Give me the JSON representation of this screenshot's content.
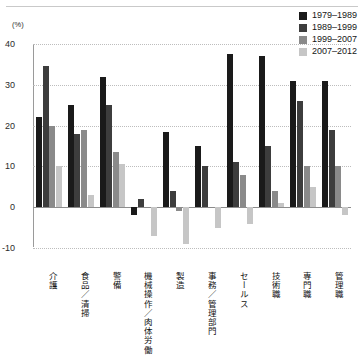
{
  "chart_data": {
    "type": "bar",
    "title": "",
    "xlabel": "",
    "ylabel": "(%)",
    "unit_label": "(%)",
    "ylim": [
      -10,
      40
    ],
    "yticks": [
      40,
      30,
      20,
      10,
      0,
      -10
    ],
    "ytick_labels": [
      "40",
      "30",
      "20",
      "10",
      "0",
      "-10"
    ],
    "grid": true,
    "legend_position": "top-right",
    "categories": [
      "介護",
      "食品／清掃",
      "警備",
      "機械操作／肉体労働",
      "製造",
      "事務／管理部門",
      "セールス",
      "技術職",
      "専門職",
      "管理職"
    ],
    "series": [
      {
        "name": "1979–1989",
        "color": "#1a1a1a",
        "values": [
          22,
          25,
          32,
          -2,
          18.5,
          15,
          37.5,
          37,
          31,
          31
        ]
      },
      {
        "name": "1989–1999",
        "color": "#3d3d3d",
        "values": [
          34.5,
          18,
          25,
          2,
          4,
          10,
          11,
          15,
          26,
          19
        ]
      },
      {
        "name": "1999–2007",
        "color": "#8a8a8a",
        "values": [
          20,
          19,
          13.5,
          0,
          -1,
          0,
          8,
          4,
          10,
          10
        ]
      },
      {
        "name": "2007–2012",
        "color": "#c6c6c6",
        "values": [
          10,
          3,
          10.5,
          -7,
          -9,
          -5,
          -4,
          1,
          5,
          -2
        ]
      }
    ]
  }
}
